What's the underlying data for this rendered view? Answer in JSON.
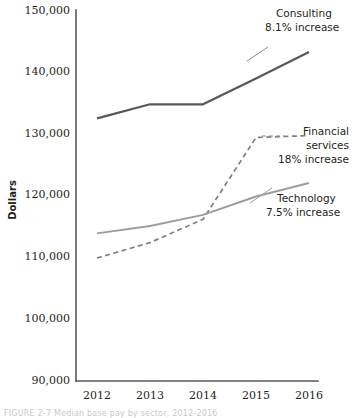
{
  "figure": {
    "yaxis_title": "Dollars",
    "caption": "FIGURE 2-7   Median base pay by sector, 2012-2016"
  },
  "chart_data": {
    "type": "line",
    "title": "",
    "xlabel": "",
    "ylabel": "Dollars",
    "x": [
      2012,
      2013,
      2014,
      2015,
      2016
    ],
    "categories": [
      "2012",
      "2013",
      "2014",
      "2015",
      "2016"
    ],
    "ylim": [
      90000,
      150000
    ],
    "xlim": [
      2012,
      2016
    ],
    "yticks": [
      90000,
      100000,
      110000,
      120000,
      130000,
      140000,
      150000
    ],
    "ytick_labels": [
      "90,000",
      "100,000",
      "110,000",
      "120,000",
      "130,000",
      "140,000",
      "150,000"
    ],
    "xtick_labels": [
      "2012",
      "2013",
      "2014",
      "2015",
      "2016"
    ],
    "grid": false,
    "legend": "annotations-inline",
    "series": [
      {
        "name": "Consulting",
        "annotation_line1": "Consulting",
        "annotation_line2": "8.1% increase",
        "color": "#55585a",
        "style": "solid",
        "width": 2.2,
        "values": [
          132700,
          135000,
          135000,
          139200,
          143500
        ]
      },
      {
        "name": "Financial services",
        "annotation_line1": "Financial",
        "annotation_line2": "services",
        "annotation_line3": "18% increase",
        "color": "#7d8082",
        "style": "dashed",
        "width": 1.7,
        "values": [
          110000,
          112500,
          116300,
          129600,
          129900
        ]
      },
      {
        "name": "Technology",
        "annotation_line1": "Technology",
        "annotation_line2": "7.5% increase",
        "color": "#9a9da0",
        "style": "solid",
        "width": 1.9,
        "values": [
          114000,
          115200,
          117000,
          120000,
          122200
        ]
      }
    ]
  }
}
